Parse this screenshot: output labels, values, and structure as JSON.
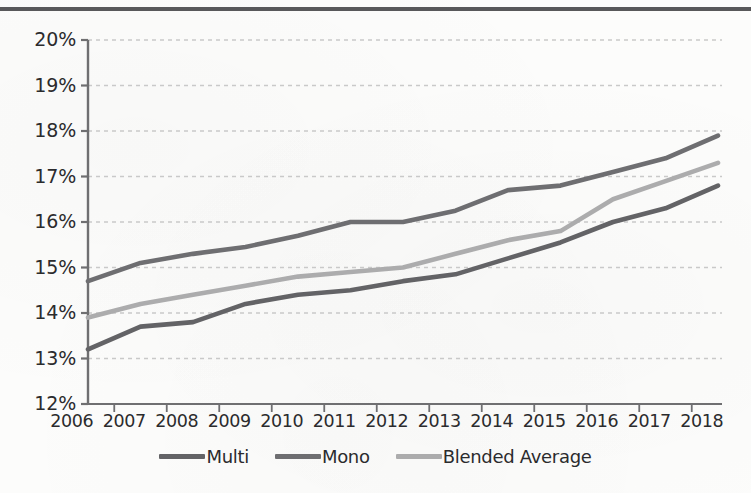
{
  "page": {
    "background_color": "#fcfcfb",
    "top_rule_color": "#58585a"
  },
  "chart_data": {
    "type": "line",
    "title": "",
    "subtitle": "",
    "xlabel": "",
    "ylabel": "",
    "categories": [
      "2006",
      "2007",
      "2008",
      "2009",
      "2010",
      "2011",
      "2012",
      "2013",
      "2014",
      "2015",
      "2016",
      "2017",
      "2018"
    ],
    "x": [
      2006,
      2007,
      2008,
      2009,
      2010,
      2011,
      2012,
      2013,
      2014,
      2015,
      2016,
      2017,
      2018
    ],
    "ylim": [
      12,
      20
    ],
    "xlim": [
      2006,
      2018
    ],
    "y_tick_labels": [
      "12%",
      "13%",
      "14%",
      "15%",
      "16%",
      "17%",
      "18%",
      "19%",
      "20%"
    ],
    "y_tick_values": [
      12,
      13,
      14,
      15,
      16,
      17,
      18,
      19,
      20
    ],
    "y_unit": "%",
    "grid": true,
    "grid_style": "dashed-horizontal",
    "grid_color": "#c9c9c9",
    "axis_color": "#6f6f71",
    "legend_position": "bottom",
    "series": [
      {
        "name": "Multi",
        "color": "#636366",
        "values": [
          13.2,
          13.7,
          13.8,
          14.2,
          14.4,
          14.5,
          14.7,
          14.85,
          15.2,
          15.55,
          16.0,
          16.3,
          16.8
        ]
      },
      {
        "name": "Mono",
        "color": "#6e6e71",
        "values": [
          14.7,
          15.1,
          15.3,
          15.45,
          15.7,
          16.0,
          16.0,
          16.25,
          16.7,
          16.8,
          17.1,
          17.4,
          17.9
        ]
      },
      {
        "name": "Blended Average",
        "color": "#acacad",
        "values": [
          13.9,
          14.2,
          14.4,
          14.6,
          14.8,
          14.9,
          15.0,
          15.3,
          15.6,
          15.8,
          16.5,
          16.9,
          17.3
        ]
      }
    ]
  },
  "legend": {
    "items": [
      {
        "label": "Multi",
        "color": "#636366"
      },
      {
        "label": "Mono",
        "color": "#6e6e71"
      },
      {
        "label": "Blended Average",
        "color": "#acacad"
      }
    ]
  }
}
